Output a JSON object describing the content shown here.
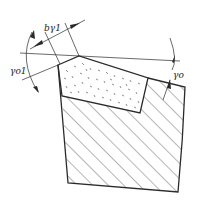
{
  "diagram": {
    "labels": {
      "chamfer_width": "bγ1",
      "chamfer_rake_angle": "γo1",
      "rake_angle": "γo"
    },
    "colors": {
      "line": "#2a2a2a",
      "background": "#ffffff"
    }
  }
}
